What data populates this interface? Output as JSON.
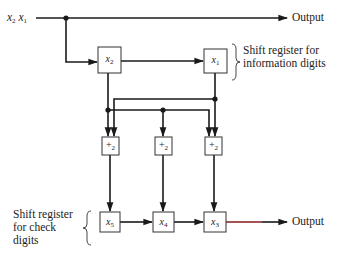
{
  "diagram": {
    "input": {
      "label_var1": "x",
      "label_sub1": "2",
      "label_var2": "x",
      "label_sub2": "1"
    },
    "top_output": {
      "label": "Output"
    },
    "bottom_output": {
      "label": "Output"
    },
    "info_register": {
      "annotation_line1": "Shift register for",
      "annotation_line2": "information digits",
      "cells": [
        {
          "var": "x",
          "sub": "2"
        },
        {
          "var": "x",
          "sub": "1"
        }
      ]
    },
    "adders": [
      {
        "symbol": "+",
        "sub": "2",
        "inputs": [
          "x2",
          "x1"
        ]
      },
      {
        "symbol": "+",
        "sub": "2",
        "inputs": [
          "x2"
        ]
      },
      {
        "symbol": "+",
        "sub": "2",
        "inputs": [
          "x2",
          "x1"
        ]
      }
    ],
    "check_register": {
      "annotation_line1": "Shift register",
      "annotation_line2": "for check",
      "annotation_line3": "digits",
      "cells": [
        {
          "var": "x",
          "sub": "5"
        },
        {
          "var": "x",
          "sub": "4"
        },
        {
          "var": "x",
          "sub": "3"
        }
      ]
    },
    "colors": {
      "line": "#1a1a1a",
      "box_border": "#333333",
      "output_line_tint": "#8b1a1a"
    }
  }
}
